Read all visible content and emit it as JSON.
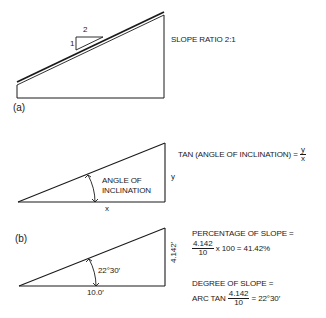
{
  "figure": {
    "panel_a": {
      "label": "(a)",
      "slope_ratio_text": "SLOPE RATIO 2:1",
      "run_label": "2",
      "rise_label": "1"
    },
    "inclination": {
      "angle_label_line1": "ANGLE OF",
      "angle_label_line2": "INCLINATION",
      "x_label": "x",
      "y_label": "y",
      "formula_prefix": "TAN (ANGLE OF INCLINATION) =",
      "formula_num": "y",
      "formula_den": "x"
    },
    "panel_b": {
      "label": "(b)",
      "angle_value": "22°30′",
      "base_value": "10.0′",
      "height_value": "4.142′",
      "percentage_title": "PERCENTAGE OF SLOPE =",
      "percentage_num": "4.142",
      "percentage_den": "10",
      "percentage_result": "x 100 = 41.42%",
      "degree_title": "DEGREE OF SLOPE =",
      "degree_prefix": "ARC TAN",
      "degree_num": "4.142",
      "degree_den": "10",
      "degree_result": "= 22°30′"
    }
  },
  "colors": {
    "line": "#1a1a1a",
    "background": "#ffffff"
  }
}
